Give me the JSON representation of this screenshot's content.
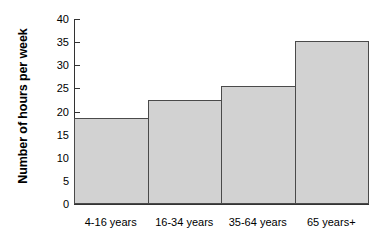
{
  "chart_data": {
    "type": "bar",
    "title": "",
    "subtitle": "",
    "xlabel": "",
    "ylabel": "Number of hours per week",
    "categories": [
      "4-16 years",
      "16-34 years",
      "35-64 years",
      "65 years+"
    ],
    "values": [
      18.5,
      22.5,
      25.5,
      35.2
    ],
    "series": [
      {
        "name": "Number of hours per week",
        "values": [
          18.5,
          22.5,
          25.5,
          35.2
        ]
      }
    ],
    "ylim": [
      0,
      40
    ],
    "ytick_labels": [
      "0",
      "5",
      "10",
      "15",
      "20",
      "25",
      "30",
      "35",
      "40"
    ],
    "ytick_values": [
      0,
      5,
      10,
      15,
      20,
      25,
      30,
      35,
      40
    ],
    "grid": false,
    "legend": false,
    "legend_position": "none",
    "bar_gap": 0,
    "colors": {
      "bar_fill": "#d2d2d2",
      "bar_border": "#4a4a4a",
      "axis": "#333333",
      "text": "#000000",
      "background": "#ffffff"
    }
  }
}
